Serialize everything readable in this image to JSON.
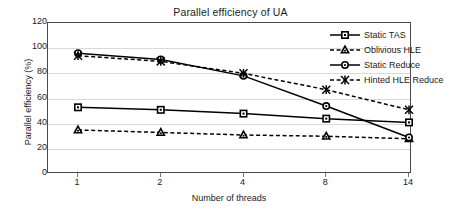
{
  "chart_data": {
    "type": "line",
    "title": "Parallel efficiency of UA",
    "xlabel": "Number of threads",
    "ylabel": "Parallel efficiency (%)",
    "categories": [
      "1",
      "2",
      "4",
      "8",
      "14"
    ],
    "ylim": [
      0,
      120
    ],
    "yticks": [
      "0",
      "20",
      "40",
      "60",
      "80",
      "100",
      "120"
    ],
    "grid": true,
    "legend_position": "top-right-inside",
    "series": [
      {
        "name": "Static TAS",
        "values": [
          53,
          51,
          48,
          44,
          41
        ],
        "marker": "square",
        "line_style": "solid",
        "color": "#000000"
      },
      {
        "name": "Oblivious HLE",
        "values": [
          35,
          33,
          31,
          30,
          28
        ],
        "marker": "triangle",
        "line_style": "dashed",
        "color": "#000000"
      },
      {
        "name": "Static Reduce",
        "values": [
          96,
          91,
          78,
          54,
          29
        ],
        "marker": "circle",
        "line_style": "solid",
        "color": "#000000"
      },
      {
        "name": "Hinted HLE Reduce",
        "values": [
          94,
          89.5,
          80,
          67,
          51
        ],
        "marker": "asterisk",
        "line_style": "dashed",
        "color": "#000000"
      }
    ]
  }
}
